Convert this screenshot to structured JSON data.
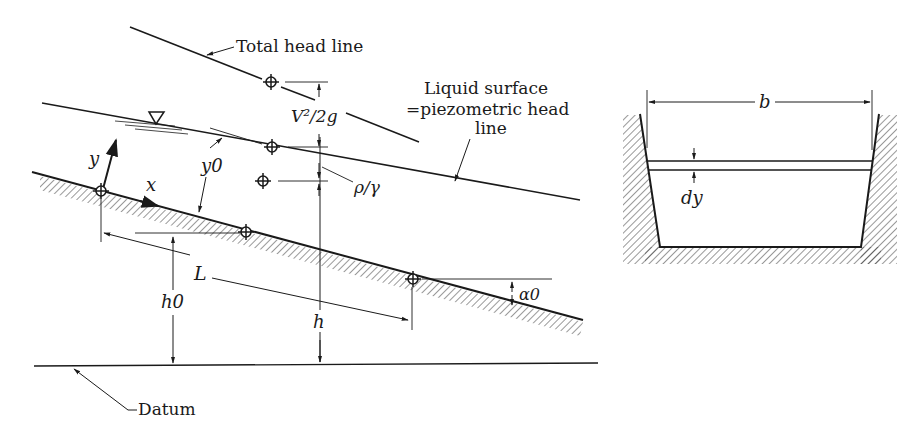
{
  "figure": {
    "profile": {
      "labels": {
        "total_head_line": "Total head line",
        "liquid_surface_1": "Liquid surface",
        "liquid_surface_2": "=piezometric head",
        "liquid_surface_3": "line",
        "velocity_head": "V²/2g",
        "pressure_head": "ρ/γ",
        "depth": "y0",
        "y_axis": "y",
        "x_axis": "x",
        "length": "L",
        "bed_height": "h0",
        "head": "h",
        "slope_angle": "α0",
        "datum": "Datum"
      },
      "symbols": {
        "free_surface": "inverted-triangle-icon",
        "reference_point": "crosshair-circle-icon"
      }
    },
    "cross_section": {
      "labels": {
        "width": "b",
        "strip_thickness": "dy"
      }
    },
    "colors": {
      "ink": "#1a1a1a",
      "background": "#ffffff"
    }
  }
}
